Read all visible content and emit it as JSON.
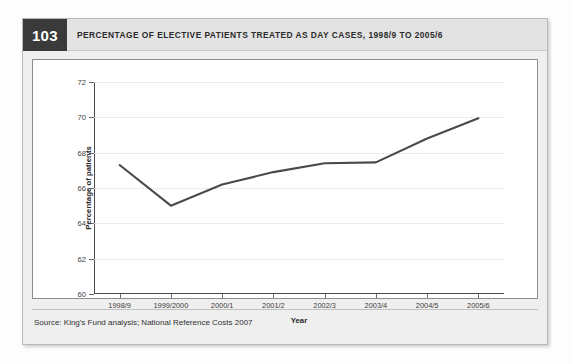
{
  "figure": {
    "number": "103",
    "title": "Percentage of elective patients treated as day cases, 1998/9 to 2005/6",
    "source": "Source: King's Fund analysis; National Reference Costs 2007"
  },
  "colors": {
    "line": "#4a4a4a",
    "figure_number_bg": "#3a3a3a",
    "header_bg": "#e3e3e3",
    "panel_bg": "#ffffff",
    "grid": "#d8d8d8"
  },
  "chart_data": {
    "type": "line",
    "title": "Percentage of elective patients treated as day cases, 1998/9 to 2005/6",
    "xlabel": "Year",
    "ylabel": "Percentage of patients",
    "categories": [
      "1998/9",
      "1999/2000",
      "2000/1",
      "2001/2",
      "2002/3",
      "2003/4",
      "2004/5",
      "2005/6"
    ],
    "values": [
      67.3,
      65.0,
      66.2,
      66.9,
      67.4,
      67.45,
      68.8,
      69.95
    ],
    "ylim": [
      60,
      72
    ],
    "yticks": [
      60,
      62,
      64,
      66,
      68,
      70,
      72
    ],
    "ytick_labels": [
      "60",
      "62",
      "64",
      "66",
      "68",
      "70",
      "72"
    ],
    "grid": "horizontal-dotted",
    "legend": "none",
    "markers": "none",
    "series": [
      {
        "name": "Percentage of elective patients treated as day cases",
        "values": [
          67.3,
          65.0,
          66.2,
          66.9,
          67.4,
          67.45,
          68.8,
          69.95
        ]
      }
    ]
  }
}
